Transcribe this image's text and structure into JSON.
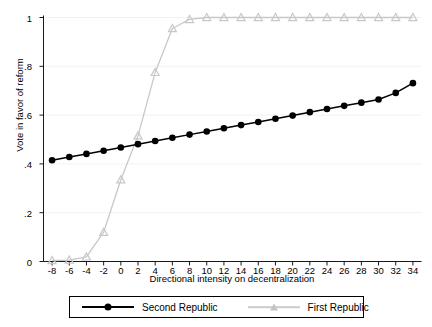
{
  "chart_data": {
    "type": "line",
    "title": "",
    "xlabel": "Directional intensity on decentralization",
    "ylabel": "Vote in favor of reform",
    "xlim": [
      -9,
      35
    ],
    "ylim": [
      0,
      1
    ],
    "grid": true,
    "legend_position": "bottom",
    "xticks": [
      "-8",
      "-6",
      "-4",
      "-2",
      "0",
      "2",
      "4",
      "6",
      "8",
      "10",
      "12",
      "14",
      "16",
      "18",
      "20",
      "22",
      "24",
      "26",
      "28",
      "30",
      "32",
      "34"
    ],
    "xtick_values": [
      -8,
      -6,
      -4,
      -2,
      0,
      2,
      4,
      6,
      8,
      10,
      12,
      14,
      16,
      18,
      20,
      22,
      24,
      26,
      28,
      30,
      32,
      34
    ],
    "yticks": [
      "0",
      ".2",
      ".4",
      ".6",
      ".8",
      "1"
    ],
    "ytick_values": [
      0,
      0.2,
      0.4,
      0.6,
      0.8,
      1
    ],
    "x": [
      -8,
      -6,
      -4,
      -2,
      0,
      2,
      4,
      6,
      8,
      10,
      12,
      14,
      16,
      18,
      20,
      22,
      24,
      26,
      28,
      30,
      32,
      34
    ],
    "series": [
      {
        "name": "Second Republic",
        "color": "#000000",
        "marker": "circle",
        "values": [
          0.415,
          0.428,
          0.441,
          0.454,
          0.467,
          0.481,
          0.494,
          0.507,
          0.52,
          0.533,
          0.546,
          0.559,
          0.572,
          0.585,
          0.598,
          0.612,
          0.625,
          0.638,
          0.651,
          0.664,
          0.691,
          0.731
        ]
      },
      {
        "name": "First Republic",
        "color": "#c8c8c8",
        "marker": "triangle",
        "values": [
          0.004,
          0.006,
          0.019,
          0.12,
          0.335,
          0.515,
          0.775,
          0.955,
          0.992,
          1.0,
          1.0,
          1.0,
          1.0,
          1.0,
          1.0,
          1.0,
          1.0,
          1.0,
          1.0,
          1.0,
          1.0,
          1.0
        ]
      }
    ],
    "legend_entries": [
      {
        "label": "Second Republic",
        "color": "#000000",
        "marker": "circle"
      },
      {
        "label": "First Republic",
        "color": "#c8c8c8",
        "marker": "triangle"
      }
    ]
  },
  "axes": {
    "y_title": "Vote in favor of reform",
    "x_title": "Directional intensity on decentralization"
  },
  "legend": {
    "second_label": "Second Republic",
    "first_label": "First Republic"
  },
  "colors": {
    "second_republic": "#000000",
    "first_republic": "#c8c8c8",
    "axis": "#000000",
    "grid": "#f2f2f2",
    "background": "#ffffff"
  }
}
